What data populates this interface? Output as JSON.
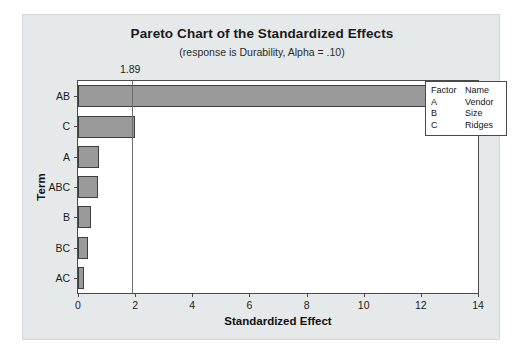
{
  "chart_data": {
    "type": "bar",
    "orientation": "horizontal",
    "title": "Pareto Chart of the Standardized Effects",
    "subtitle": "(response is Durability, Alpha = .10)",
    "xlabel": "Standardized Effect",
    "ylabel": "Term",
    "categories": [
      "AB",
      "C",
      "A",
      "ABC",
      "B",
      "BC",
      "AC"
    ],
    "values": [
      12.8,
      2.0,
      0.75,
      0.7,
      0.45,
      0.35,
      0.2
    ],
    "xlim": [
      0,
      14
    ],
    "xticks": [
      0,
      2,
      4,
      6,
      8,
      10,
      12,
      14
    ],
    "xtick_labels": [
      "0",
      "2",
      "4",
      "6",
      "8",
      "10",
      "12",
      "14"
    ],
    "grid": false,
    "reference_line": {
      "value": 1.89,
      "label": "1.89"
    },
    "legend": {
      "position": "right",
      "headers": [
        "Factor",
        "Name"
      ],
      "rows": [
        {
          "factor": "A",
          "name": "Vendor"
        },
        {
          "factor": "B",
          "name": "Size"
        },
        {
          "factor": "C",
          "name": "Ridges"
        }
      ]
    },
    "colors": {
      "bar_fill": "#9a9a9a",
      "bar_border": "#3d3d3d",
      "panel_background": "#e6e9ea",
      "plot_background": "#ffffff",
      "axis": "#4a4a4a",
      "reference_line": "#6e6e6e"
    }
  }
}
